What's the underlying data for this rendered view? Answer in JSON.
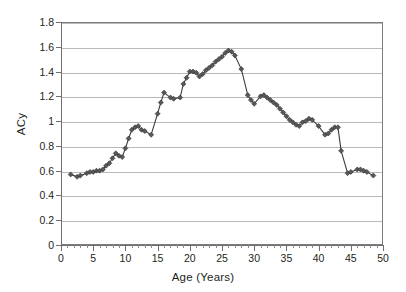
{
  "chart_data": {
    "type": "line",
    "title": "",
    "xlabel": "Age (Years)",
    "ylabel": "ACy",
    "xlim": [
      0,
      50
    ],
    "ylim": [
      0,
      1.8
    ],
    "grid": true,
    "legend": null,
    "y_ticks": [
      "0",
      "0.2",
      "0.4",
      "0.6",
      "0.8",
      "1",
      "1.2",
      "1.4",
      "1.6",
      "1.8"
    ],
    "y_tick_values": [
      0,
      0.2,
      0.4,
      0.6,
      0.8,
      1.0,
      1.2,
      1.4,
      1.6,
      1.8
    ],
    "x_ticks": [
      "0",
      "5",
      "10",
      "15",
      "20",
      "25",
      "30",
      "35",
      "40",
      "45",
      "50"
    ],
    "x_tick_values": [
      0,
      5,
      10,
      15,
      20,
      25,
      30,
      35,
      40,
      45,
      50
    ],
    "x_minor_tick_step": 1,
    "series": [
      {
        "name": "ACy",
        "marker": "diamond",
        "color": "#595959",
        "line_color": "#3c3c3c",
        "x": [
          1.5,
          2.5,
          3.0,
          4.0,
          4.5,
          5.0,
          5.5,
          6.0,
          6.5,
          7.0,
          7.5,
          8.0,
          8.5,
          9.0,
          9.5,
          10.0,
          10.5,
          11.0,
          11.5,
          12.0,
          12.5,
          13.0,
          14.0,
          15.0,
          15.5,
          16.0,
          17.0,
          17.5,
          18.5,
          19.0,
          19.5,
          20.0,
          20.5,
          21.0,
          21.5,
          22.0,
          22.5,
          23.0,
          23.5,
          24.0,
          24.5,
          25.0,
          25.5,
          26.0,
          26.5,
          27.0,
          28.0,
          29.0,
          29.5,
          30.0,
          31.0,
          31.5,
          32.0,
          32.5,
          33.0,
          33.5,
          34.0,
          34.5,
          35.0,
          35.5,
          36.0,
          36.5,
          37.0,
          37.5,
          38.0,
          38.5,
          39.0,
          40.0,
          41.0,
          41.5,
          42.0,
          42.5,
          43.0,
          43.5,
          44.5,
          45.0,
          46.0,
          46.5,
          47.0,
          47.5,
          48.5
        ],
        "y": [
          0.57,
          0.55,
          0.56,
          0.58,
          0.59,
          0.59,
          0.6,
          0.6,
          0.61,
          0.64,
          0.66,
          0.7,
          0.74,
          0.72,
          0.71,
          0.78,
          0.86,
          0.93,
          0.95,
          0.96,
          0.93,
          0.92,
          0.89,
          1.06,
          1.15,
          1.23,
          1.19,
          1.18,
          1.19,
          1.3,
          1.35,
          1.4,
          1.4,
          1.39,
          1.36,
          1.38,
          1.41,
          1.43,
          1.45,
          1.48,
          1.5,
          1.52,
          1.55,
          1.57,
          1.56,
          1.53,
          1.42,
          1.21,
          1.17,
          1.14,
          1.2,
          1.21,
          1.19,
          1.17,
          1.15,
          1.13,
          1.1,
          1.07,
          1.04,
          1.01,
          0.99,
          0.97,
          0.96,
          0.99,
          1.0,
          1.02,
          1.01,
          0.96,
          0.89,
          0.9,
          0.93,
          0.95,
          0.95,
          0.76,
          0.58,
          0.59,
          0.61,
          0.61,
          0.6,
          0.59,
          0.56
        ]
      }
    ]
  }
}
